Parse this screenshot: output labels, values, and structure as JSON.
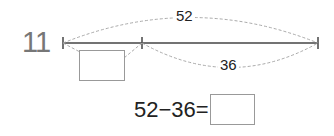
{
  "question": {
    "number": "11"
  },
  "diagram": {
    "total_label": "52",
    "part_label": "36",
    "unknown_box": ""
  },
  "equation": {
    "text": "52−36=",
    "answer": ""
  },
  "colors": {
    "line": "#444444",
    "dashed": "#aaaaaa",
    "box_border": "#999999",
    "number": "#777777"
  }
}
